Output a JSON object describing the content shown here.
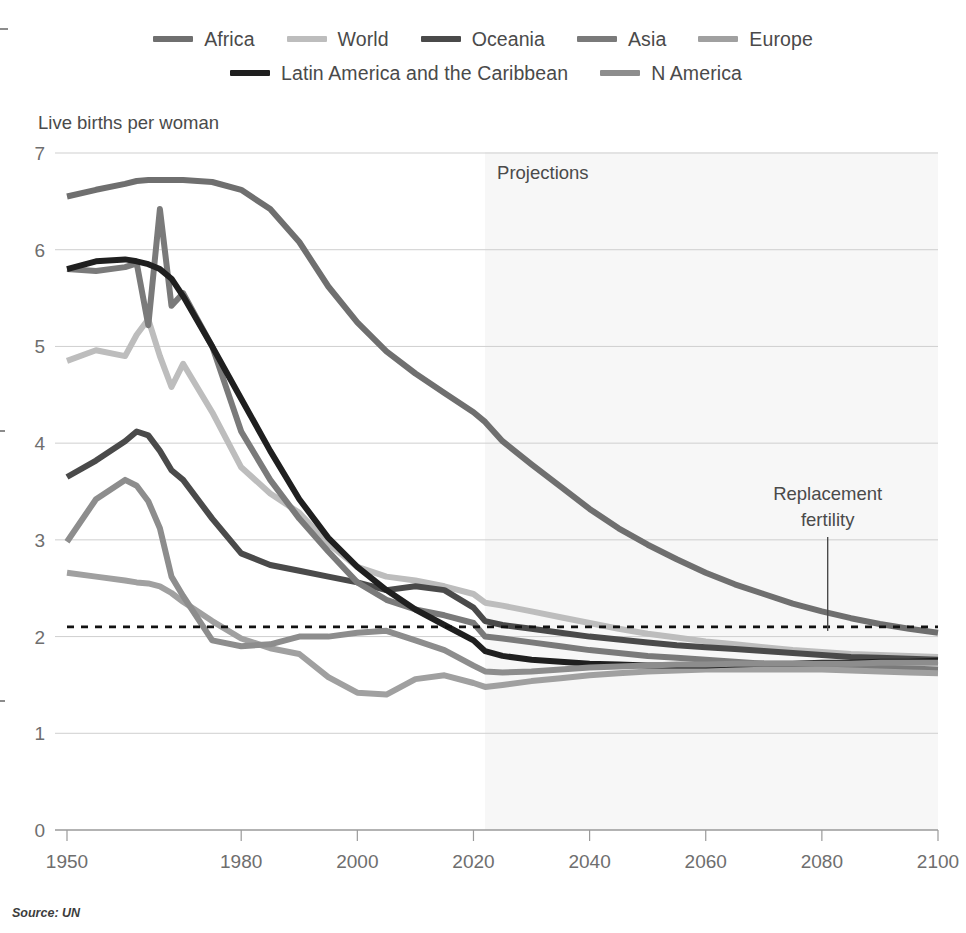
{
  "legend": {
    "rows": [
      [
        {
          "label": "Africa",
          "color": "#6f6f6f"
        },
        {
          "label": "World",
          "color": "#bdbdbd"
        },
        {
          "label": "Oceania",
          "color": "#4a4a4a"
        },
        {
          "label": "Asia",
          "color": "#7a7a7a"
        },
        {
          "label": "Europe",
          "color": "#a0a0a0"
        }
      ],
      [
        {
          "label": "Latin America and the Caribbean",
          "color": "#1f1f1f"
        },
        {
          "label": "N America",
          "color": "#8d8d8d"
        }
      ]
    ]
  },
  "axis_title": "Live births per woman",
  "annotations": {
    "projections": "Projections",
    "replacement_line1": "Replacement",
    "replacement_line2": "fertility"
  },
  "source": "Source: UN",
  "chart_data": {
    "type": "line",
    "title": "",
    "xlabel": "",
    "ylabel": "Live births per woman",
    "xlim": [
      1950,
      2100
    ],
    "ylim": [
      0,
      7
    ],
    "xticks": [
      1950,
      1980,
      2000,
      2020,
      2040,
      2060,
      2080,
      2100
    ],
    "yticks": [
      0,
      1,
      2,
      3,
      4,
      5,
      6,
      7
    ],
    "grid": "horizontal",
    "legend_position": "top",
    "projection_start": 2022,
    "projection_shade_color": "#f7f7f7",
    "replacement_fertility_level": 2.1,
    "replacement_marker_year": 2081,
    "x": [
      1950,
      1955,
      1960,
      1962,
      1964,
      1966,
      1968,
      1970,
      1975,
      1980,
      1985,
      1990,
      1995,
      2000,
      2005,
      2010,
      2015,
      2020,
      2022,
      2025,
      2030,
      2035,
      2040,
      2045,
      2050,
      2055,
      2060,
      2065,
      2070,
      2075,
      2080,
      2085,
      2090,
      2095,
      2100
    ],
    "series": [
      {
        "name": "Africa",
        "color": "#6f6f6f",
        "width": 6,
        "values": [
          6.55,
          6.62,
          6.68,
          6.71,
          6.72,
          6.72,
          6.72,
          6.72,
          6.7,
          6.62,
          6.42,
          6.08,
          5.62,
          5.25,
          4.95,
          4.72,
          4.52,
          4.32,
          4.22,
          4.02,
          3.78,
          3.55,
          3.32,
          3.12,
          2.95,
          2.8,
          2.66,
          2.54,
          2.44,
          2.34,
          2.26,
          2.19,
          2.13,
          2.08,
          2.04
        ]
      },
      {
        "name": "World",
        "color": "#bdbdbd",
        "width": 6,
        "values": [
          4.85,
          4.96,
          4.9,
          5.12,
          5.28,
          4.9,
          4.58,
          4.82,
          4.32,
          3.75,
          3.48,
          3.28,
          2.96,
          2.72,
          2.62,
          2.58,
          2.52,
          2.44,
          2.35,
          2.32,
          2.26,
          2.2,
          2.14,
          2.08,
          2.03,
          1.99,
          1.95,
          1.92,
          1.89,
          1.86,
          1.84,
          1.82,
          1.81,
          1.8,
          1.79
        ]
      },
      {
        "name": "Oceania",
        "color": "#4a4a4a",
        "width": 6,
        "values": [
          3.65,
          3.82,
          4.02,
          4.12,
          4.08,
          3.92,
          3.72,
          3.62,
          3.22,
          2.86,
          2.74,
          2.68,
          2.62,
          2.56,
          2.48,
          2.52,
          2.48,
          2.3,
          2.16,
          2.12,
          2.08,
          2.04,
          2.0,
          1.97,
          1.94,
          1.91,
          1.89,
          1.87,
          1.85,
          1.83,
          1.81,
          1.79,
          1.78,
          1.77,
          1.76
        ]
      },
      {
        "name": "Asia",
        "color": "#7a7a7a",
        "width": 6,
        "values": [
          5.8,
          5.78,
          5.82,
          5.86,
          5.22,
          6.42,
          5.42,
          5.55,
          5.0,
          4.12,
          3.62,
          3.22,
          2.88,
          2.56,
          2.38,
          2.28,
          2.22,
          2.14,
          2.0,
          1.98,
          1.94,
          1.9,
          1.86,
          1.83,
          1.8,
          1.78,
          1.76,
          1.74,
          1.72,
          1.71,
          1.7,
          1.69,
          1.68,
          1.67,
          1.66
        ]
      },
      {
        "name": "Europe",
        "color": "#a0a0a0",
        "width": 6,
        "values": [
          2.66,
          2.62,
          2.58,
          2.56,
          2.55,
          2.52,
          2.45,
          2.36,
          2.16,
          1.98,
          1.88,
          1.82,
          1.58,
          1.42,
          1.4,
          1.56,
          1.6,
          1.52,
          1.48,
          1.5,
          1.54,
          1.57,
          1.6,
          1.62,
          1.64,
          1.65,
          1.66,
          1.66,
          1.66,
          1.66,
          1.66,
          1.65,
          1.64,
          1.63,
          1.62
        ]
      },
      {
        "name": "Latin America and the Caribbean",
        "color": "#1f1f1f",
        "width": 6,
        "values": [
          5.8,
          5.88,
          5.9,
          5.88,
          5.85,
          5.8,
          5.7,
          5.52,
          5.0,
          4.46,
          3.92,
          3.42,
          3.02,
          2.72,
          2.48,
          2.28,
          2.12,
          1.96,
          1.85,
          1.8,
          1.76,
          1.74,
          1.72,
          1.71,
          1.7,
          1.7,
          1.7,
          1.71,
          1.72,
          1.72,
          1.73,
          1.73,
          1.74,
          1.74,
          1.75
        ]
      },
      {
        "name": "N America",
        "color": "#8d8d8d",
        "width": 6,
        "values": [
          2.98,
          3.42,
          3.62,
          3.56,
          3.4,
          3.12,
          2.62,
          2.42,
          1.96,
          1.9,
          1.92,
          2.0,
          2.0,
          2.04,
          2.06,
          1.96,
          1.86,
          1.7,
          1.64,
          1.63,
          1.64,
          1.66,
          1.68,
          1.69,
          1.7,
          1.71,
          1.71,
          1.72,
          1.72,
          1.72,
          1.72,
          1.72,
          1.73,
          1.73,
          1.73
        ]
      }
    ]
  }
}
